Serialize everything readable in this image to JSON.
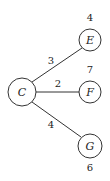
{
  "diagram": {
    "type": "weighted-tree",
    "nodes": [
      {
        "id": "C",
        "label": "C",
        "value": null,
        "cx": 22,
        "cy": 92,
        "r": 14
      },
      {
        "id": "E",
        "label": "E",
        "value": "4",
        "cx": 90,
        "cy": 40,
        "r": 11
      },
      {
        "id": "F",
        "label": "F",
        "value": "7",
        "cx": 90,
        "cy": 92,
        "r": 11
      },
      {
        "id": "G",
        "label": "G",
        "value": "6",
        "cx": 90,
        "cy": 146,
        "r": 12
      }
    ],
    "edges": [
      {
        "from": "C",
        "to": "E",
        "weight": "3"
      },
      {
        "from": "C",
        "to": "F",
        "weight": "2"
      },
      {
        "from": "C",
        "to": "G",
        "weight": "4"
      }
    ]
  }
}
